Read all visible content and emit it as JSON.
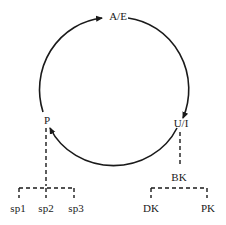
{
  "diagram": {
    "cycle_nodes": [
      {
        "id": "ae",
        "label": "A/E"
      },
      {
        "id": "ui",
        "label": "U/I"
      },
      {
        "id": "p",
        "label": "P"
      }
    ],
    "cycle_edges": [
      {
        "from": "P",
        "to": "A/E",
        "style": "solid-arrow"
      },
      {
        "from": "A/E",
        "to": "U/I",
        "style": "solid-arrow"
      },
      {
        "from": "U/I",
        "to": "P",
        "style": "solid-arrow"
      }
    ],
    "left_branch": {
      "parent": "P",
      "children": [
        "sp1",
        "sp2",
        "sp3"
      ],
      "style": "dashed"
    },
    "right_branch": {
      "parent": "U/I",
      "intermediate": "BK",
      "children": [
        "DK",
        "PK"
      ],
      "style": "dashed"
    },
    "colors": {
      "line": "#1a1a1a",
      "background": "#ffffff"
    }
  }
}
